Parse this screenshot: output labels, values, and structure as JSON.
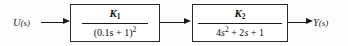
{
  "diagram": {
    "type": "control-system-block-diagram",
    "background_color": "#fdfdfd",
    "line_color": "#1a1a1a",
    "input": {
      "label": "U(s)",
      "variable": "U",
      "argument": "(s)"
    },
    "output": {
      "label": "Y(s)",
      "variable": "Y",
      "argument": "(s)"
    },
    "blocks": [
      {
        "id": "block-1",
        "transfer_function": "K_1 / (0.1s + 1)^2",
        "numerator": "K",
        "numerator_subscript": "1",
        "denominator_text": "(0.1s + 1)",
        "denominator_exponent": "2",
        "denominator_full": "(0.1s + 1)^2"
      },
      {
        "id": "block-2",
        "transfer_function": "K_2 / (4s^2 + 2s + 1)",
        "numerator": "K",
        "numerator_subscript": "2",
        "denominator_term1_coeff": "4",
        "denominator_term1_var": "s",
        "denominator_term1_exp": "2",
        "denominator_term2": "+ 2",
        "denominator_term2_var": "s",
        "denominator_term3": "+ 1",
        "denominator_full": "4s^2 + 2s + 1"
      }
    ],
    "connections": [
      {
        "from": "input",
        "to": "block-1",
        "name": "wire-input"
      },
      {
        "from": "block-1",
        "to": "block-2",
        "name": "wire-middle"
      },
      {
        "from": "block-2",
        "to": "output",
        "name": "wire-output"
      }
    ]
  }
}
